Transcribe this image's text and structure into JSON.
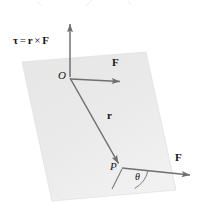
{
  "figure": {
    "equation": {
      "tau": "τ",
      "equals": "=",
      "r": "r",
      "cross": "×",
      "F": "F",
      "full_text": "τ = r × F"
    },
    "labels": {
      "origin": "O",
      "point": "P",
      "force_top": "F",
      "force_bottom": "F",
      "position_vector": "r",
      "angle": "θ"
    },
    "colors": {
      "plane_fill": "#e8e8e8",
      "plane_stroke": "#dcdcdc",
      "vector_stroke": "#6b6b6b",
      "text": "#141414",
      "background": "#ffffff"
    },
    "geometry": {
      "plane_corners": [
        [
          22,
          62
        ],
        [
          146,
          52
        ],
        [
          176,
          190
        ],
        [
          52,
          201
        ]
      ],
      "origin_point": [
        70,
        77
      ],
      "p_point": [
        122,
        167
      ],
      "tau_arrow_tip": [
        70,
        19
      ],
      "force_top_arrow_tip": [
        126,
        82
      ],
      "force_bottom_arrow_tip": [
        196,
        176
      ],
      "r_extension_tip": [
        110,
        188
      ],
      "theta_degrees": 38
    }
  }
}
